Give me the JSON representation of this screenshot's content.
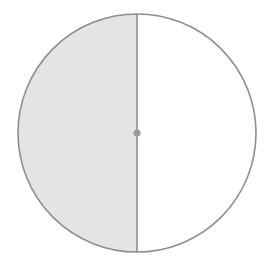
{
  "figure": {
    "name": "half-shaded-circle",
    "background_color": "#ffffff",
    "canvas": {
      "width": 277,
      "height": 265
    },
    "circle": {
      "center_x": 137,
      "center_y": 133,
      "radius": 119,
      "stroke_color": "#8e8e8e",
      "stroke_width": 1.6,
      "unshaded_fill": "#ffffff"
    },
    "shaded_region": {
      "label": "left-half",
      "fill_color": "#e4e4e4",
      "fraction": "1/2"
    },
    "diameter_line": {
      "orientation": "vertical",
      "x": 137,
      "y_start": 14,
      "y_end": 252,
      "stroke_color": "#8e8e8e",
      "stroke_width": 1.6
    },
    "center_point": {
      "x": 137,
      "y": 133,
      "radius": 3.6,
      "fill_color": "#9a9a9a"
    }
  }
}
